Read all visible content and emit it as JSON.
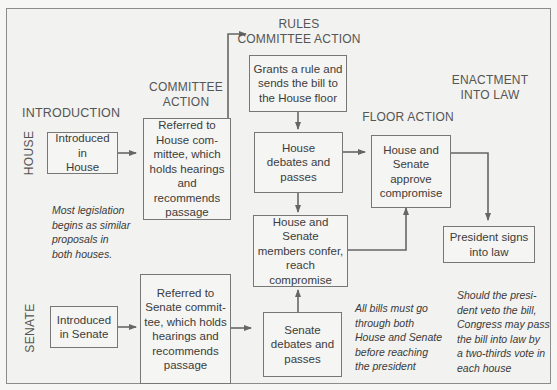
{
  "diagram": {
    "headings": {
      "introduction": "INTRODUCTION",
      "committee_action": "COMMITTEE\nACTION",
      "rules_committee_action": "RULES\nCOMMITTEE ACTION",
      "floor_action": "FLOOR ACTION",
      "enactment": "ENACTMENT\nINTO LAW"
    },
    "side_labels": {
      "house": "HOUSE",
      "senate": "SENATE"
    },
    "nodes": {
      "house_intro": "Introduced in\nHouse",
      "house_committee": "Referred to\nHouse com-\nmittee, which\nholds hearings\nand recommends\npassage",
      "rules": "Grants a rule and\nsends the bill to\nthe House floor",
      "house_floor": "House\ndebates and\npasses",
      "conference": "House and Senate\nmembers confer,\nreach\ncompromise",
      "approve": "House and\nSenate\napprove\ncompromise",
      "president": "President signs\ninto law",
      "senate_intro": "Introduced\nin Senate",
      "senate_committee": "Referred to\nSenate commit-\ntee, which holds\nhearings and\nrecommends\npassage",
      "senate_floor": "Senate\ndebates and\npasses"
    },
    "notes": {
      "similar_proposals": "Most legislation\nbegins as similar\nproposals in\nboth houses.",
      "both_houses": "All bills must go\nthrough both\nHouse and Senate\nbefore reaching\nthe president",
      "veto": "Should the presi-\ndent veto the bill,\nCongress may pass\nthe bill into law by\na two-thirds vote in\neach house"
    },
    "edges": [
      {
        "from": "house_intro",
        "to": "house_committee"
      },
      {
        "from": "house_committee",
        "to": "rules"
      },
      {
        "from": "rules",
        "to": "house_floor"
      },
      {
        "from": "house_floor",
        "to": "approve"
      },
      {
        "from": "house_floor",
        "to": "conference"
      },
      {
        "from": "senate_intro",
        "to": "senate_committee"
      },
      {
        "from": "senate_committee",
        "to": "senate_floor"
      },
      {
        "from": "senate_floor",
        "to": "conference"
      },
      {
        "from": "conference",
        "to": "approve"
      },
      {
        "from": "approve",
        "to": "president"
      }
    ]
  }
}
